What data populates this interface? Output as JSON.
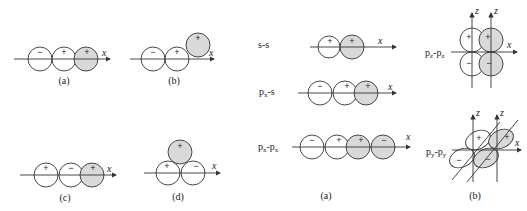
{
  "left_panel": {
    "diagrams": [
      {
        "id": "a",
        "caption": "(a)",
        "signs": [
          "−",
          "+",
          "+"
        ],
        "axis_label": "x"
      },
      {
        "id": "b",
        "caption": "(b)",
        "signs": [
          "−",
          "+",
          "+"
        ],
        "axis_label": "x"
      },
      {
        "id": "c",
        "caption": "(c)",
        "signs": [
          "+",
          "−",
          "+"
        ],
        "axis_label": "x"
      },
      {
        "id": "d",
        "caption": "(d)",
        "signs": [
          "+",
          "−",
          "+"
        ],
        "axis_label": "x"
      }
    ]
  },
  "right_panel_a": {
    "caption": "(a)",
    "rows": [
      {
        "label": "s-s",
        "signs": [
          "+",
          "+"
        ],
        "axis_label": "x"
      },
      {
        "label_main": "p",
        "label_sub": "x",
        "label_rest": "-s",
        "signs": [
          "−",
          "+",
          "+"
        ],
        "axis_label": "x"
      },
      {
        "label_main": "p",
        "label_sub": "x",
        "label_rest": "-p",
        "label_sub2": "x",
        "signs": [
          "−",
          "+",
          "+",
          "−"
        ],
        "axis_label": "x"
      }
    ]
  },
  "right_panel_b": {
    "caption": "(b)",
    "pz": {
      "label_main": "p",
      "label_sub": "z",
      "label_rest": "-p",
      "label_sub2": "z",
      "signs": [
        "+",
        "+",
        "−",
        "−"
      ],
      "axis_x": "x",
      "axis_z": "z"
    },
    "py": {
      "label_main": "p",
      "label_sub": "y",
      "label_rest": "-p",
      "label_sub2": "y",
      "signs": [
        "+",
        "+",
        "−",
        "−"
      ],
      "axis_x": "x",
      "axis_z": "z"
    }
  }
}
